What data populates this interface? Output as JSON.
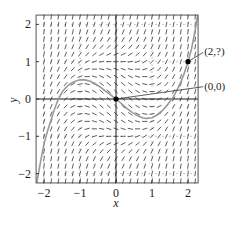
{
  "chart_data": {
    "type": "slope-field",
    "title": "",
    "xlabel": "x",
    "ylabel": "y",
    "xlim": [
      -2.22,
      2.28
    ],
    "ylim": [
      -2.25,
      2.25
    ],
    "x_ticks": [
      -2,
      -1,
      0,
      1,
      2
    ],
    "y_ticks": [
      -2,
      -1,
      0,
      1,
      2
    ],
    "x_tick_labels": [
      "−2",
      "−1",
      "0",
      "1",
      "2"
    ],
    "y_tick_labels": [
      "−2",
      "−1",
      "0",
      "1",
      "2"
    ],
    "grid": true,
    "field": {
      "equation": "dy/dx = x^2 + y^2 - 1",
      "spacing": 0.2,
      "range": [
        -2.2,
        2.2
      ]
    },
    "solution_curve": {
      "points": [
        [
          -2.2,
          -2.25
        ],
        [
          -2.1,
          -1.7
        ],
        [
          -2.0,
          -1.2
        ],
        [
          -1.9,
          -0.85
        ],
        [
          -1.8,
          -0.55
        ],
        [
          -1.7,
          -0.25
        ],
        [
          -1.6,
          0.0
        ],
        [
          -1.5,
          0.18
        ],
        [
          -1.4,
          0.3
        ],
        [
          -1.3,
          0.39
        ],
        [
          -1.2,
          0.45
        ],
        [
          -1.05,
          0.5
        ],
        [
          -0.9,
          0.52
        ],
        [
          -0.75,
          0.49
        ],
        [
          -0.6,
          0.42
        ],
        [
          -0.45,
          0.33
        ],
        [
          -0.3,
          0.22
        ],
        [
          -0.15,
          0.11
        ],
        [
          0,
          0
        ],
        [
          0.15,
          -0.12
        ],
        [
          0.3,
          -0.25
        ],
        [
          0.45,
          -0.36
        ],
        [
          0.6,
          -0.45
        ],
        [
          0.75,
          -0.51
        ],
        [
          0.85,
          -0.52
        ],
        [
          1.0,
          -0.5
        ],
        [
          1.15,
          -0.42
        ],
        [
          1.3,
          -0.3
        ],
        [
          1.45,
          -0.13
        ],
        [
          1.6,
          0.07
        ],
        [
          1.7,
          0.25
        ],
        [
          1.8,
          0.45
        ],
        [
          1.9,
          0.7
        ],
        [
          2.0,
          1.0
        ],
        [
          2.1,
          1.35
        ],
        [
          2.2,
          1.85
        ],
        [
          2.27,
          2.25
        ]
      ],
      "color": "#9a9a9a"
    },
    "marked_points": [
      {
        "x": 2,
        "y": 1,
        "label": "(2,?)",
        "label_x": 2.45,
        "label_y": 1.25
      },
      {
        "x": 0,
        "y": 0,
        "label": "(0,0)",
        "label_x": 2.45,
        "label_y": 0.33
      }
    ]
  },
  "colors": {
    "axis": "#1a1a1a",
    "field": "#333333",
    "grid": "#9a9a9a",
    "curve": "#9a9a9a"
  }
}
